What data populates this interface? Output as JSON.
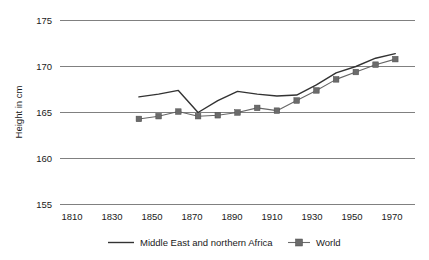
{
  "chart_data": {
    "type": "line",
    "title": "",
    "subtitle": "",
    "xlabel": "",
    "ylabel": "Height in cm",
    "xlim": [
      1810,
      1990
    ],
    "ylim": [
      155,
      175
    ],
    "grid": true,
    "legend_position": "bottom",
    "x_ticks": [
      1810,
      1830,
      1850,
      1870,
      1890,
      1910,
      1930,
      1950,
      1970
    ],
    "y_ticks": [
      155,
      160,
      165,
      170,
      175
    ],
    "series": [
      {
        "name": "Middle East and northern Africa",
        "style": "line",
        "color": "#333333",
        "x": [
          1850,
          1860,
          1870,
          1880,
          1890,
          1900,
          1910,
          1920,
          1930,
          1940,
          1950,
          1960,
          1970,
          1980
        ],
        "values": [
          166.7,
          167.0,
          167.4,
          165.0,
          166.3,
          167.3,
          167.0,
          166.8,
          166.9,
          168.0,
          169.3,
          170.0,
          170.9,
          171.4
        ]
      },
      {
        "name": "World",
        "style": "line-marker",
        "color": "#6b6b6b",
        "x": [
          1850,
          1860,
          1870,
          1880,
          1890,
          1900,
          1910,
          1920,
          1930,
          1940,
          1950,
          1960,
          1970,
          1980
        ],
        "values": [
          164.3,
          164.6,
          165.1,
          164.6,
          164.7,
          165.0,
          165.5,
          165.2,
          166.3,
          167.4,
          168.6,
          169.4,
          170.2,
          170.8
        ]
      }
    ]
  },
  "axis": {
    "y_title": "Height in cm",
    "y_ticks": [
      "175",
      "170",
      "165",
      "160",
      "155"
    ],
    "x_ticks": [
      "1810",
      "1830",
      "1850",
      "1870",
      "1890",
      "1910",
      "1930",
      "1950",
      "1970"
    ]
  },
  "legend": {
    "items": [
      {
        "label": "Middle East and northern Africa",
        "marker": "line"
      },
      {
        "label": "World",
        "marker": "line-square"
      }
    ]
  }
}
